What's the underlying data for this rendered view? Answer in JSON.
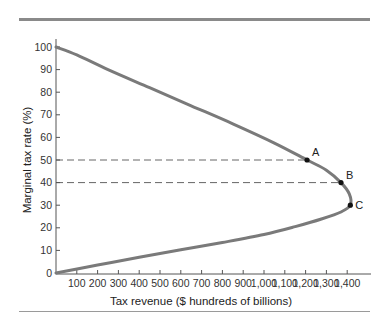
{
  "chart_data": {
    "type": "line",
    "title": "",
    "xlabel": "Tax revenue ($ hundreds of billions)",
    "ylabel": "Marginal tax rate (%)",
    "xlim": [
      0,
      1500
    ],
    "ylim": [
      0,
      100
    ],
    "grid": false,
    "legend": null,
    "x_ticks": [
      100,
      200,
      300,
      400,
      500,
      600,
      700,
      800,
      900,
      1000,
      1100,
      1200,
      1300,
      1400
    ],
    "x_tick_labels": [
      "100",
      "200",
      "300",
      "400",
      "500",
      "600",
      "700",
      "800",
      "900",
      "1,000",
      "1,100",
      "1,200",
      "1,300",
      "1,400"
    ],
    "y_ticks": [
      0,
      10,
      20,
      30,
      40,
      50,
      60,
      70,
      80,
      90,
      100
    ],
    "y_tick_labels": [
      "0",
      "10",
      "20",
      "30",
      "40",
      "50",
      "60",
      "70",
      "80",
      "90",
      "100"
    ],
    "series": [
      {
        "name": "Laffer curve",
        "color": "#7a7a7a",
        "points": [
          [
            0,
            0
          ],
          [
            200,
            3.5
          ],
          [
            400,
            7
          ],
          [
            600,
            10.3
          ],
          [
            800,
            13.5
          ],
          [
            1000,
            17
          ],
          [
            1150,
            20.5
          ],
          [
            1280,
            24
          ],
          [
            1370,
            27
          ],
          [
            1415,
            30
          ],
          [
            1410,
            35
          ],
          [
            1370,
            40
          ],
          [
            1300,
            45.5
          ],
          [
            1207,
            50
          ],
          [
            1050,
            57.5
          ],
          [
            850,
            66
          ],
          [
            650,
            74
          ],
          [
            450,
            82
          ],
          [
            250,
            90
          ],
          [
            100,
            96.5
          ],
          [
            0,
            100
          ]
        ]
      }
    ],
    "annotations": [
      {
        "label": "A",
        "x": 1207,
        "y": 50,
        "reference_line": "dashed horizontal to y-axis"
      },
      {
        "label": "B",
        "x": 1370,
        "y": 40,
        "reference_line": "dashed horizontal to y-axis"
      },
      {
        "label": "C",
        "x": 1415,
        "y": 30
      }
    ]
  }
}
